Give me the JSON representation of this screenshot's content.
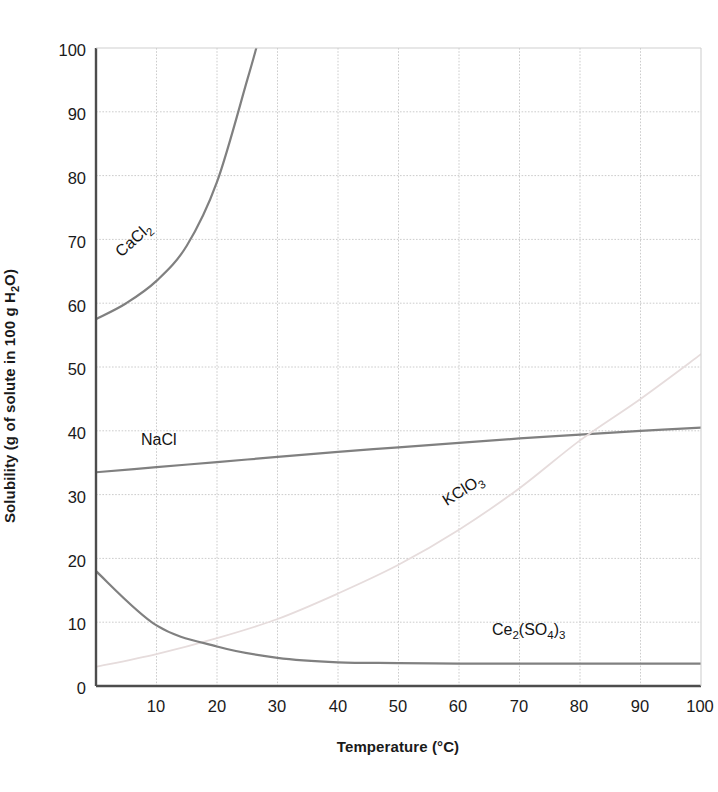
{
  "axes": {
    "ylabel_parts": {
      "pre": "Solubility (g of solute in 100 g H",
      "sub": "2",
      "post": "O)"
    },
    "ylabel_text": "Solubility (g of solute in 100 g H2O)",
    "xlabel_parts": {
      "pre": "Temperature (",
      "deg": "°C",
      "post": ")"
    },
    "xlabel_text": "Temperature (°C)",
    "yticks": [
      "0",
      "10",
      "20",
      "30",
      "40",
      "50",
      "60",
      "70",
      "80",
      "90",
      "100"
    ],
    "xticks": [
      "10",
      "20",
      "30",
      "40",
      "50",
      "60",
      "70",
      "80",
      "90",
      "100"
    ]
  },
  "curve_labels": {
    "cacl2": {
      "pre": "CaCl",
      "sub": "2",
      "post": ""
    },
    "nacl": {
      "pre": "NaCl",
      "sub": "",
      "post": ""
    },
    "kclo3": {
      "pre": "KClO",
      "sub": "3",
      "post": ""
    },
    "ce2so43": {
      "pre": "Ce",
      "sub": "2",
      "post": "(SO",
      "sub2": "4",
      "post2": ")",
      "sub3": "3"
    }
  },
  "colors": {
    "curve_gray": "#808080",
    "curve_faint": "#e6dcdc",
    "axis": "#4d4d4d",
    "grid": "#cccccc",
    "text": "#141414",
    "background": "#ffffff"
  },
  "chart_data": {
    "type": "line",
    "title": "",
    "xlabel": "Temperature (°C)",
    "ylabel": "Solubility (g of solute in 100 g H2O)",
    "xlim": [
      0,
      100
    ],
    "ylim": [
      0,
      100
    ],
    "xticks": [
      0,
      10,
      20,
      30,
      40,
      50,
      60,
      70,
      80,
      90,
      100
    ],
    "yticks": [
      0,
      10,
      20,
      30,
      40,
      50,
      60,
      70,
      80,
      90,
      100
    ],
    "grid": true,
    "legend": "inline-curve-labels",
    "x": [
      0,
      10,
      20,
      30,
      40,
      50,
      60,
      70,
      80,
      90,
      100
    ],
    "series": [
      {
        "name": "CaCl2",
        "label": "CaCl2",
        "color": "#808080",
        "clipped_at_top": true,
        "exits_top_at_x": 26.5,
        "x": [
          0,
          5,
          10,
          15,
          20,
          25,
          26.5
        ],
        "values": [
          57.5,
          60.0,
          63.5,
          69.0,
          79.0,
          95.0,
          100.0
        ]
      },
      {
        "name": "NaCl",
        "label": "NaCl",
        "color": "#808080",
        "x": [
          0,
          10,
          20,
          30,
          40,
          50,
          60,
          70,
          80,
          90,
          100
        ],
        "values": [
          33.5,
          34.3,
          35.1,
          35.9,
          36.7,
          37.4,
          38.1,
          38.8,
          39.4,
          40.0,
          40.5
        ]
      },
      {
        "name": "KClO3",
        "label": "KClO3",
        "color": "#e6dcdc",
        "x": [
          0,
          10,
          20,
          30,
          40,
          50,
          60,
          70,
          80,
          90,
          100
        ],
        "values": [
          3.0,
          5.0,
          7.5,
          10.5,
          14.5,
          19.0,
          24.5,
          31.0,
          38.5,
          45.0,
          52.0
        ]
      },
      {
        "name": "Ce2(SO4)3",
        "label": "Ce2(SO4)3",
        "color": "#808080",
        "x": [
          0,
          10,
          20,
          30,
          40,
          50,
          60,
          70,
          80,
          90,
          100
        ],
        "values": [
          18.0,
          9.5,
          6.2,
          4.4,
          3.7,
          3.6,
          3.5,
          3.5,
          3.5,
          3.5,
          3.5
        ]
      }
    ]
  }
}
